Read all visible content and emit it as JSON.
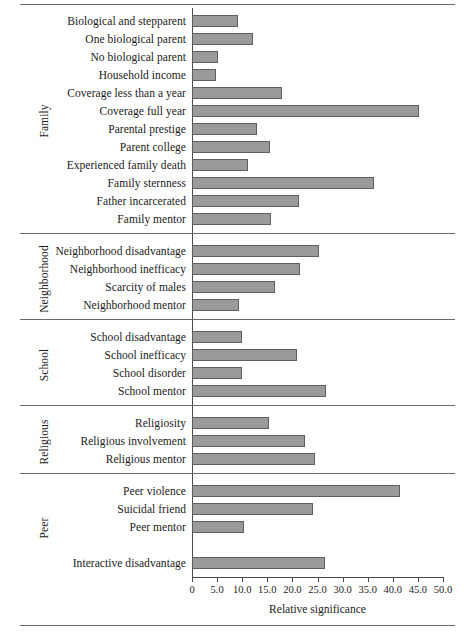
{
  "chart_data": {
    "type": "bar",
    "orientation": "horizontal",
    "title": "",
    "xlabel": "Relative significance",
    "ylabel": "",
    "xlim": [
      0,
      50
    ],
    "grid": false,
    "legend": null,
    "tick_labels": [
      "0",
      "5.0",
      "10.0",
      "15.0",
      "20.0",
      "25.0",
      "30.0",
      "35.0",
      "40.0",
      "45.0",
      "50.0"
    ],
    "tick_values": [
      0,
      5,
      10,
      15,
      20,
      25,
      30,
      35,
      40,
      45,
      50
    ],
    "bar_color": "#9a9a9a",
    "bar_edge_color": "#5e5e5e",
    "groups": [
      {
        "name": "Family",
        "categories": [
          "Biological and stepparent",
          "One biological parent",
          "No biological parent",
          "Household income",
          "Coverage less than a year",
          "Coverage full year",
          "Parental prestige",
          "Parent college",
          "Experienced family death",
          "Family sternness",
          "Father incarcerated",
          "Family mentor"
        ],
        "values": [
          9.2,
          12.2,
          5.2,
          4.8,
          17.9,
          45.2,
          12.9,
          15.5,
          11.2,
          36.3,
          21.3,
          15.7
        ]
      },
      {
        "name": "Neighborhood",
        "categories": [
          "Neighborhood disadvantage",
          "Neighborhood inefficacy",
          "Scarcity of males",
          "Neighborhood mentor"
        ],
        "values": [
          25.3,
          21.5,
          16.5,
          9.4
        ]
      },
      {
        "name": "School",
        "categories": [
          "School disadvantage",
          "School inefficacy",
          "School disorder",
          "School mentor"
        ],
        "values": [
          9.9,
          21.0,
          9.9,
          26.7
        ]
      },
      {
        "name": "Religious",
        "categories": [
          "Religiosity",
          "Religious involvement",
          "Religious mentor"
        ],
        "values": [
          15.3,
          22.5,
          24.5
        ]
      },
      {
        "name": "Peer",
        "categories": [
          "Peer violence",
          "Suicidal friend",
          "Peer mentor",
          "",
          "Interactive disadvantage"
        ],
        "values": [
          41.4,
          24.1,
          10.4,
          null,
          26.5
        ]
      }
    ]
  }
}
